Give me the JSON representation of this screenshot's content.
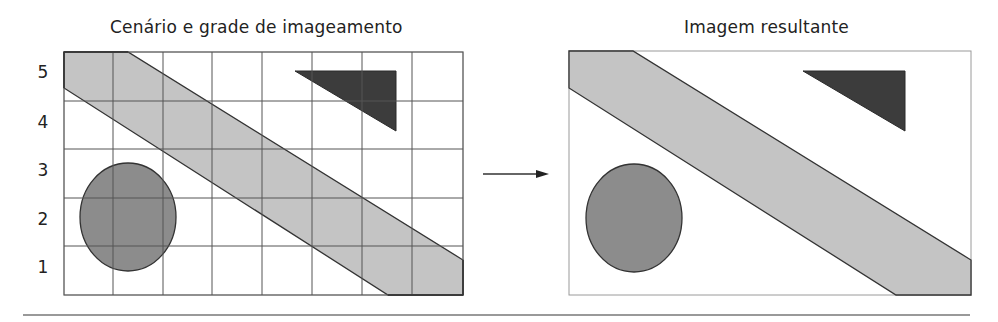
{
  "panels": {
    "left": {
      "title": "Cenário e grade de imageamento",
      "grid": {
        "columns": 8,
        "rows": 5,
        "show_grid": true
      },
      "y_axis_labels": [
        "5",
        "4",
        "3",
        "2",
        "1"
      ]
    },
    "right": {
      "title": "Imagem resultante",
      "grid": {
        "columns": 8,
        "rows": 5,
        "show_grid": false
      }
    }
  },
  "shapes": [
    {
      "type": "diagonal-band",
      "fill": "#c4c4c4"
    },
    {
      "type": "triangle",
      "fill": "#3c3c3c"
    },
    {
      "type": "ellipse",
      "fill": "#8c8c8c"
    }
  ],
  "arrow": {
    "direction": "right"
  },
  "colors": {
    "grid_line": "#555555",
    "outline": "#333333",
    "frame": "#9a9a9a",
    "rule": "#777777"
  }
}
